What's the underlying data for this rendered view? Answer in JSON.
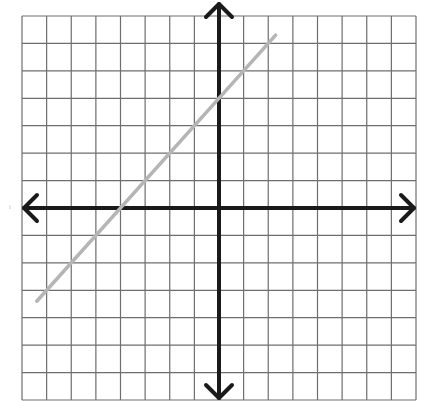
{
  "chart_data": {
    "type": "line",
    "title": "",
    "xlabel": "",
    "ylabel": "",
    "xlim": [
      -8,
      8
    ],
    "ylim": [
      -7,
      7
    ],
    "grid": true,
    "grid_step": 1,
    "axes_arrows": true,
    "legend": null,
    "series": [
      {
        "name": "line",
        "equation": "y = x + 4",
        "slope": 1,
        "y_intercept": 4,
        "x_intercept": -4,
        "x": [
          -7.4,
          2.3
        ],
        "y": [
          -3.4,
          6.3
        ],
        "color": "#b5b5b5"
      }
    ]
  },
  "style": {
    "grid_color": "#6e6e6e",
    "axis_color": "#1a1a1a",
    "background": "#ffffff"
  },
  "margin_mark": "ı"
}
